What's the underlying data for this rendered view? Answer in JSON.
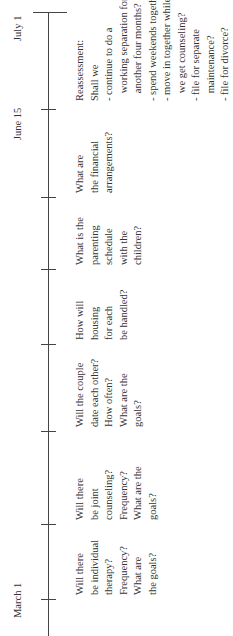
{
  "timeline": {
    "start_label": "March 1",
    "mid_label": "June 15",
    "end_label": "July 1",
    "columns": [
      {
        "lines": [
          "Will there",
          "be individual",
          "therapy?",
          "Frequency?",
          "What are",
          "the goals?"
        ]
      },
      {
        "lines": [
          "Will there",
          "be joint",
          "counseling?",
          "Frequency?",
          "What are the",
          "goals?"
        ]
      },
      {
        "lines": [
          "Will the couple",
          "date each other?",
          "How often?",
          "What are the",
          "goals?"
        ]
      },
      {
        "lines": [
          "How will",
          "housing",
          "for each",
          "be handled?"
        ]
      },
      {
        "lines": [
          "What is the",
          "parenting",
          "schedule",
          "with the",
          "children?"
        ]
      },
      {
        "lines": [
          "What are",
          "the financial",
          "arrangements?"
        ]
      },
      {
        "lines": [
          "Reassessment:",
          "Shall we",
          "- continue to do a",
          "   working separation for",
          "   another four months?",
          "- spend weekends together?",
          "- move in together while",
          "   we get counseling?",
          "- file for separate",
          "   maintenance?",
          "- file for divorce?"
        ]
      }
    ]
  },
  "colors": {
    "line": "#444444",
    "text": "#333333"
  }
}
